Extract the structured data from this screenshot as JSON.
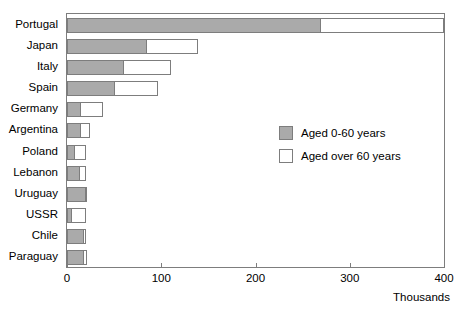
{
  "chart_data": {
    "type": "bar",
    "orientation": "horizontal",
    "stacked": true,
    "title": "",
    "xlabel": "Thousands",
    "ylabel": "",
    "xlim": [
      0,
      400
    ],
    "xticks": [
      0,
      100,
      200,
      300,
      400
    ],
    "xtick_labels": [
      "0",
      "100",
      "200",
      "300",
      "400"
    ],
    "grid": false,
    "legend_position": "inside-right",
    "categories": [
      "Portugal",
      "Japan",
      "Italy",
      "Spain",
      "Germany",
      "Argentina",
      "Poland",
      "Lebanon",
      "Uruguay",
      "USSR",
      "Chile",
      "Paraguay"
    ],
    "series": [
      {
        "name": "Aged 0-60 years",
        "color": "#aaaaaa",
        "values": [
          268,
          84,
          59,
          50,
          14,
          14,
          7,
          13,
          19,
          4,
          17,
          17
        ]
      },
      {
        "name": "Aged over 60 years",
        "color": "#ffffff",
        "values": [
          132,
          55,
          51,
          47,
          24,
          10,
          13,
          7,
          2,
          16,
          3,
          4
        ]
      }
    ],
    "totals": [
      400,
      139,
      110,
      97,
      38,
      24,
      20,
      20,
      21,
      20,
      20,
      21
    ]
  },
  "legend": {
    "items": [
      {
        "label": "Aged 0-60 years",
        "swatch": "#aaaaaa"
      },
      {
        "label": "Aged over 60 years",
        "swatch": "#ffffff"
      }
    ]
  },
  "axis": {
    "unit_label": "Thousands",
    "frame_color": "#7d7d7d"
  }
}
